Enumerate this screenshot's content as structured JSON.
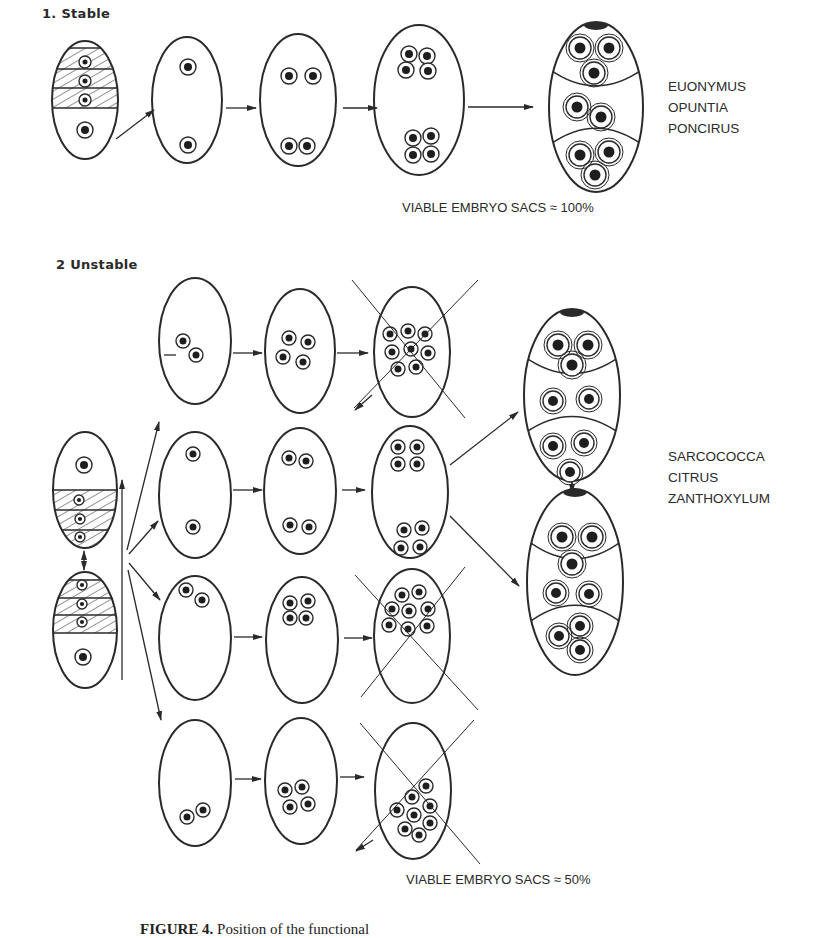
{
  "figure": {
    "sections": [
      {
        "id": "stable",
        "heading": "1. Stable",
        "species": [
          "EUONYMUS",
          "OPUNTIA",
          "PONCIRUS"
        ],
        "viable_label": "VIABLE EMBRYO SACS ≈ 100%"
      },
      {
        "id": "unstable",
        "heading": "2 Unstable",
        "species": [
          "SARCOCOCCA",
          "CITRUS",
          "ZANTHOXYLUM"
        ],
        "viable_label": "VIABLE EMBRYO SACS ≈ 50%"
      }
    ],
    "caption": {
      "label": "FIGURE 4.",
      "text": "Position of the functional"
    }
  },
  "colors": {
    "stroke": "#2a2a2a",
    "nucleus": "#1e1e1e",
    "background": "#ffffff"
  },
  "shapes": {
    "ovals": [
      {
        "id": "s-megaspore",
        "cx": 85,
        "cy": 100,
        "rx": 33,
        "ry": 59,
        "hatch": {
          "top": 48,
          "bottom": 108,
          "lines": [
            69,
            88
          ]
        },
        "nuclei": [
          [
            85,
            62,
            6
          ],
          [
            85,
            81,
            6
          ],
          [
            85,
            100,
            6
          ],
          [
            85,
            130,
            8
          ]
        ],
        "small": [
          0,
          1,
          2
        ]
      },
      {
        "id": "s-2n",
        "cx": 187,
        "cy": 100,
        "rx": 35,
        "ry": 63,
        "nuclei": [
          [
            188,
            67,
            8
          ],
          [
            188,
            145,
            8
          ]
        ]
      },
      {
        "id": "s-4n",
        "cx": 298,
        "cy": 100,
        "rx": 38,
        "ry": 66,
        "nuclei": [
          [
            289,
            76,
            8
          ],
          [
            313,
            76,
            8
          ],
          [
            289,
            146,
            8
          ],
          [
            307,
            146,
            8
          ]
        ]
      },
      {
        "id": "s-8n",
        "cx": 419,
        "cy": 100,
        "rx": 45,
        "ry": 75,
        "nuclei": [
          [
            409,
            54,
            8
          ],
          [
            427,
            56,
            8
          ],
          [
            406,
            70,
            8
          ],
          [
            428,
            71,
            8
          ],
          [
            413,
            138,
            8
          ],
          [
            431,
            136,
            8
          ],
          [
            413,
            155,
            8
          ],
          [
            431,
            154,
            8
          ]
        ]
      },
      {
        "id": "s-mature",
        "cx": 596,
        "cy": 107,
        "rx": 47,
        "ry": 85,
        "nuclei": [
          [
            580,
            48,
            11
          ],
          [
            609,
            48,
            11
          ],
          [
            594,
            73,
            11
          ],
          [
            577,
            107,
            11
          ],
          [
            601,
            117,
            11
          ],
          [
            580,
            155,
            11
          ],
          [
            609,
            152,
            11
          ],
          [
            595,
            175,
            11
          ]
        ],
        "mature": true
      },
      {
        "id": "u-megaspore-a",
        "cx": 85,
        "cy": 490,
        "rx": 32,
        "ry": 58,
        "hatch": {
          "top": 490,
          "bottom": 550,
          "lines": [
            510,
            530
          ]
        },
        "nuclei": [
          [
            84,
            465,
            8
          ],
          [
            79,
            500,
            5
          ],
          [
            80,
            519,
            5
          ],
          [
            80,
            537,
            5
          ]
        ],
        "small": [
          1,
          2,
          3
        ]
      },
      {
        "id": "u-megaspore-b",
        "cx": 85,
        "cy": 630,
        "rx": 32,
        "ry": 58,
        "hatch": {
          "top": 580,
          "bottom": 633,
          "lines": [
            598,
            615
          ]
        },
        "nuclei": [
          [
            82,
            585,
            5
          ],
          [
            82,
            604,
            5
          ],
          [
            82,
            622,
            5
          ],
          [
            83,
            657,
            8
          ]
        ],
        "small": [
          0,
          1,
          2
        ]
      },
      {
        "id": "u-r1-c1",
        "cx": 195,
        "cy": 341,
        "rx": 36,
        "ry": 63,
        "nuclei": [
          [
            183,
            341,
            7
          ],
          [
            196,
            355,
            7
          ]
        ]
      },
      {
        "id": "u-r1-c2",
        "cx": 300,
        "cy": 351,
        "rx": 35,
        "ry": 62,
        "nuclei": [
          [
            289,
            338,
            7
          ],
          [
            308,
            342,
            7
          ],
          [
            283,
            357,
            7
          ],
          [
            303,
            362,
            7
          ]
        ]
      },
      {
        "id": "u-r1-c3",
        "cx": 412,
        "cy": 352,
        "rx": 38,
        "ry": 65,
        "nuclei": [
          [
            390,
            334,
            7
          ],
          [
            408,
            331,
            7
          ],
          [
            425,
            334,
            7
          ],
          [
            392,
            352,
            7
          ],
          [
            411,
            349,
            7
          ],
          [
            428,
            353,
            7
          ],
          [
            398,
            369,
            7
          ],
          [
            416,
            367,
            7
          ]
        ],
        "crossed": true
      },
      {
        "id": "u-r2-c1",
        "cx": 195,
        "cy": 495,
        "rx": 36,
        "ry": 63,
        "nuclei": [
          [
            193,
            454,
            7
          ],
          [
            193,
            527,
            7
          ]
        ]
      },
      {
        "id": "u-r2-c2",
        "cx": 300,
        "cy": 491,
        "rx": 36,
        "ry": 63,
        "nuclei": [
          [
            289,
            458,
            7
          ],
          [
            306,
            461,
            7
          ],
          [
            290,
            525,
            7
          ],
          [
            309,
            527,
            7
          ]
        ]
      },
      {
        "id": "u-r2-c3",
        "cx": 410,
        "cy": 492,
        "rx": 38,
        "ry": 66,
        "nuclei": [
          [
            398,
            447,
            7
          ],
          [
            417,
            447,
            7
          ],
          [
            398,
            464,
            7
          ],
          [
            417,
            464,
            7
          ],
          [
            404,
            530,
            7
          ],
          [
            422,
            528,
            7
          ],
          [
            401,
            548,
            7
          ],
          [
            420,
            547,
            7
          ]
        ]
      },
      {
        "id": "u-r3-c1",
        "cx": 195,
        "cy": 638,
        "rx": 36,
        "ry": 62,
        "nuclei": [
          [
            186,
            590,
            7
          ],
          [
            202,
            600,
            7
          ]
        ]
      },
      {
        "id": "u-r3-c2",
        "cx": 302,
        "cy": 640,
        "rx": 36,
        "ry": 63,
        "nuclei": [
          [
            290,
            603,
            7
          ],
          [
            308,
            601,
            7
          ],
          [
            290,
            618,
            7
          ],
          [
            306,
            618,
            7
          ]
        ]
      },
      {
        "id": "u-r3-c3",
        "cx": 412,
        "cy": 636,
        "rx": 38,
        "ry": 67,
        "nuclei": [
          [
            402,
            595,
            7
          ],
          [
            419,
            592,
            7
          ],
          [
            392,
            609,
            7
          ],
          [
            409,
            611,
            7
          ],
          [
            428,
            609,
            7
          ],
          [
            389,
            625,
            7
          ],
          [
            408,
            629,
            7
          ],
          [
            427,
            626,
            7
          ]
        ],
        "crossed": true
      },
      {
        "id": "u-r4-c1",
        "cx": 195,
        "cy": 783,
        "rx": 36,
        "ry": 63,
        "nuclei": [
          [
            187,
            817,
            7
          ],
          [
            203,
            810,
            7
          ]
        ]
      },
      {
        "id": "u-r4-c2",
        "cx": 301,
        "cy": 781,
        "rx": 36,
        "ry": 63,
        "nuclei": [
          [
            285,
            790,
            7
          ],
          [
            302,
            787,
            7
          ],
          [
            290,
            807,
            7
          ],
          [
            308,
            804,
            7
          ]
        ]
      },
      {
        "id": "u-r4-c3",
        "cx": 413,
        "cy": 791,
        "rx": 38,
        "ry": 68,
        "nuclei": [
          [
            426,
            786,
            7
          ],
          [
            412,
            797,
            7
          ],
          [
            430,
            806,
            7
          ],
          [
            397,
            810,
            7
          ],
          [
            414,
            815,
            7
          ],
          [
            430,
            823,
            7
          ],
          [
            405,
            829,
            7
          ],
          [
            419,
            835,
            7
          ]
        ],
        "crossed": true
      },
      {
        "id": "u-mature-a",
        "cx": 572,
        "cy": 395,
        "rx": 48,
        "ry": 86,
        "nuclei": [
          [
            558,
            345,
            11
          ],
          [
            588,
            345,
            11
          ],
          [
            572,
            365,
            11
          ],
          [
            553,
            401,
            10
          ],
          [
            589,
            399,
            10
          ],
          [
            553,
            446,
            10
          ],
          [
            584,
            443,
            10
          ],
          [
            570,
            472,
            10
          ]
        ],
        "mature": true
      },
      {
        "id": "u-mature-b",
        "cx": 575,
        "cy": 582,
        "rx": 48,
        "ry": 93,
        "nuclei": [
          [
            562,
            537,
            11
          ],
          [
            592,
            537,
            11
          ],
          [
            572,
            564,
            11
          ],
          [
            556,
            593,
            10
          ],
          [
            589,
            594,
            10
          ],
          [
            559,
            636,
            10
          ],
          [
            580,
            626,
            10
          ],
          [
            580,
            650,
            10
          ]
        ],
        "mature": true
      }
    ],
    "crosses": [
      {
        "target": "u-r1-c3",
        "lines": [
          [
            352,
            280,
            465,
            418
          ],
          [
            478,
            280,
            354,
            408
          ]
        ]
      },
      {
        "target": "u-r3-c3",
        "lines": [
          [
            355,
            575,
            478,
            710
          ],
          [
            465,
            567,
            361,
            697
          ]
        ]
      },
      {
        "target": "u-r4-c3",
        "lines": [
          [
            360,
            723,
            480,
            864
          ],
          [
            474,
            720,
            356,
            850
          ]
        ]
      }
    ],
    "arrows": [
      {
        "from": [
          116,
          139
        ],
        "to": [
          154,
          110
        ]
      },
      {
        "from": [
          226,
          108
        ],
        "to": [
          256,
          108
        ]
      },
      {
        "from": [
          343,
          108
        ],
        "to": [
          377,
          108
        ]
      },
      {
        "from": [
          468,
          107
        ],
        "to": [
          533,
          107
        ]
      },
      {
        "from": [
          164,
          355
        ],
        "to": [
          176,
          355
        ],
        "head": false
      },
      {
        "from": [
          233,
          353
        ],
        "to": [
          262,
          353
        ]
      },
      {
        "from": [
          337,
          353
        ],
        "to": [
          368,
          353
        ]
      },
      {
        "from": [
          233,
          490
        ],
        "to": [
          262,
          490
        ]
      },
      {
        "from": [
          342,
          490
        ],
        "to": [
          365,
          490
        ]
      },
      {
        "from": [
          234,
          637
        ],
        "to": [
          262,
          637
        ]
      },
      {
        "from": [
          344,
          638
        ],
        "to": [
          372,
          638
        ]
      },
      {
        "from": [
          235,
          779
        ],
        "to": [
          261,
          779
        ]
      },
      {
        "from": [
          340,
          777
        ],
        "to": [
          364,
          777
        ]
      },
      {
        "from": [
          127,
          550
        ],
        "to": [
          159,
          422
        ]
      },
      {
        "from": [
          129,
          554
        ],
        "to": [
          158,
          521
        ]
      },
      {
        "from": [
          129,
          563
        ],
        "to": [
          160,
          600
        ]
      },
      {
        "from": [
          128,
          570
        ],
        "to": [
          161,
          720
        ]
      },
      {
        "from": [
          450,
          465
        ],
        "to": [
          518,
          412
        ]
      },
      {
        "from": [
          450,
          516
        ],
        "to": [
          519,
          586
        ]
      },
      {
        "from": [
          84,
          551
        ],
        "to": [
          84,
          570
        ],
        "double": true
      },
      {
        "from": [
          572,
          482
        ],
        "to": [
          572,
          493
        ],
        "double": true
      },
      {
        "from": [
          122,
          680
        ],
        "to": [
          122,
          480
        ]
      },
      {
        "from": [
          372,
          395
        ],
        "to": [
          355,
          410
        ],
        "head": true
      },
      {
        "from": [
          373,
          840
        ],
        "to": [
          356,
          851
        ],
        "head": true
      }
    ]
  }
}
